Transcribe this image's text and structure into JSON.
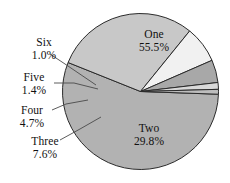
{
  "chart_data": {
    "type": "pie",
    "title": "",
    "subtitle": "",
    "xlabel": "",
    "ylabel": "",
    "legend_position": "none",
    "grid": false,
    "labels_show_percent": true,
    "start_angle_deg": 2,
    "direction": "clockwise",
    "categories": [
      "One",
      "Two",
      "Three",
      "Four",
      "Five",
      "Six"
    ],
    "values": [
      55.5,
      29.8,
      7.6,
      4.7,
      1.4,
      1.0
    ],
    "units": "%",
    "slices": [
      {
        "name": "One",
        "percent": 55.5,
        "percent_text": "55.5%",
        "color": "#b2b2b2",
        "label_placement": "inside"
      },
      {
        "name": "Two",
        "percent": 29.8,
        "percent_text": "29.8%",
        "color": "#c8c8c8",
        "label_placement": "inside"
      },
      {
        "name": "Three",
        "percent": 7.6,
        "percent_text": "7.6%",
        "color": "#f1f1f1",
        "label_placement": "outside"
      },
      {
        "name": "Four",
        "percent": 4.7,
        "percent_text": "4.7%",
        "color": "#a8a8a8",
        "label_placement": "outside"
      },
      {
        "name": "Five",
        "percent": 1.4,
        "percent_text": "1.4%",
        "color": "#d9d9d9",
        "label_placement": "outside"
      },
      {
        "name": "Six",
        "percent": 1.0,
        "percent_text": "1.0%",
        "color": "#bdbdbd",
        "label_placement": "outside"
      }
    ],
    "colors": {
      "one": "#b2b2b2",
      "two": "#c8c8c8",
      "three": "#f1f1f1",
      "four": "#a8a8a8",
      "five": "#d9d9d9",
      "six": "#bdbdbd",
      "outline": "#2b2b2b",
      "leader": "#4a4a4a",
      "text": "#111111",
      "background": "#ffffff"
    },
    "geometry": {
      "center_x": 140.5,
      "center_y": 91.5,
      "radius": 78
    }
  }
}
